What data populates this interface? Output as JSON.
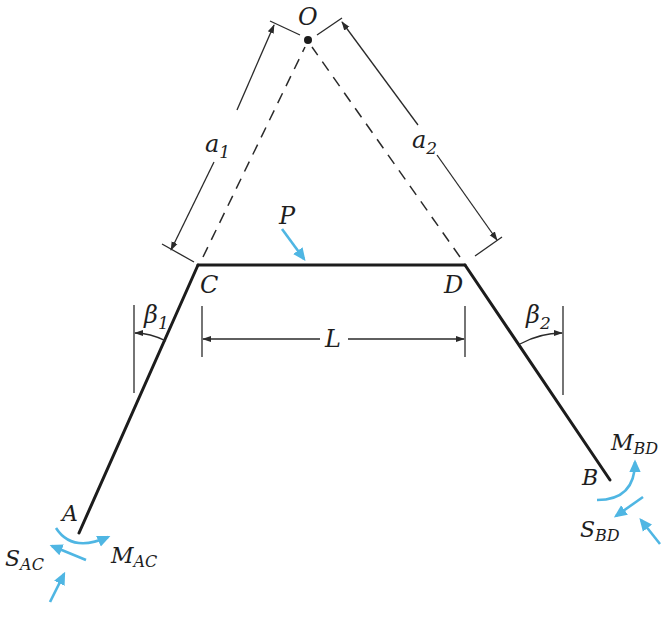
{
  "figure": {
    "type": "structural frame free-body diagram",
    "accent_color": "#4fb6e3",
    "line_color": "#1c1c1c"
  },
  "points": {
    "O": {
      "label": "O",
      "x": 308,
      "y": 40
    },
    "C": {
      "label": "C",
      "x": 198,
      "y": 265
    },
    "D": {
      "label": "D",
      "x": 465,
      "y": 265
    },
    "A": {
      "label": "A",
      "x": 79,
      "y": 533
    },
    "B": {
      "label": "B",
      "x": 610,
      "y": 480
    }
  },
  "labels": {
    "O": "O",
    "C": "C",
    "D": "D",
    "A": "A",
    "B": "B",
    "P": "P",
    "L": "L",
    "a1_main": "a",
    "a1_sub": "1",
    "a2_main": "a",
    "a2_sub": "2",
    "beta1_main": "β",
    "beta1_sub": "1",
    "beta2_main": "β",
    "beta2_sub": "2",
    "S_AC_main": "S",
    "S_AC_sub": "AC",
    "M_AC_main": "M",
    "M_AC_sub": "AC",
    "S_BD_main": "S",
    "S_BD_sub": "BD",
    "M_BD_main": "M",
    "M_BD_sub": "BD"
  },
  "members": [
    {
      "name": "AC",
      "from": "A",
      "to": "C"
    },
    {
      "name": "CD",
      "from": "C",
      "to": "D"
    },
    {
      "name": "DB",
      "from": "D",
      "to": "B"
    }
  ],
  "dimensions": [
    {
      "name": "a1",
      "description": "distance from O to C along member AC extension"
    },
    {
      "name": "a2",
      "description": "distance from O to D along member BD extension"
    },
    {
      "name": "L",
      "description": "horizontal span between C and D"
    },
    {
      "name": "beta1",
      "description": "angle of member AC from vertical"
    },
    {
      "name": "beta2",
      "description": "angle of member BD from vertical"
    }
  ],
  "loads": [
    {
      "name": "P",
      "description": "applied load on beam CD"
    },
    {
      "name": "S_AC",
      "description": "shear at end A"
    },
    {
      "name": "M_AC",
      "description": "moment at end A"
    },
    {
      "name": "S_BD",
      "description": "shear at end B"
    },
    {
      "name": "M_BD",
      "description": "moment at end B"
    }
  ]
}
